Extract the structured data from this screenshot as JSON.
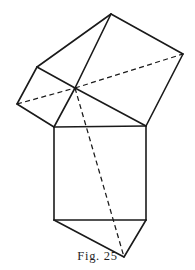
{
  "figure": {
    "caption": "Fig. 25",
    "caption_x": 97,
    "caption_y": 257,
    "background_color": "#ffffff",
    "line_color": "#1a1a1a",
    "solid_stroke_width": 1.6,
    "hidden_stroke_width": 1.25,
    "hidden_dash_pattern": "5 3.4",
    "canvas": {
      "width": 195,
      "height": 270
    },
    "vertices": {
      "apex_top": [
        111,
        14
      ],
      "upper_left": [
        37,
        67
      ],
      "left": [
        17,
        104
      ],
      "center": [
        75,
        88
      ],
      "right": [
        183,
        54
      ],
      "rect_top_left": [
        54,
        127
      ],
      "rect_top_right": [
        146,
        126
      ],
      "rect_bottom_right": [
        146,
        220
      ],
      "rect_bottom_left": [
        54,
        220
      ],
      "bottom_apex": [
        124,
        257
      ]
    },
    "solid_edges": [
      {
        "name": "apex-to-upper-left",
        "points": "111,14 37,67"
      },
      {
        "name": "upper-left-to-left",
        "points": "37,67 17,104"
      },
      {
        "name": "left-to-rect-top-left",
        "points": "17,104 54,127"
      },
      {
        "name": "apex-to-right",
        "points": "111,14 183,54"
      },
      {
        "name": "right-to-rect-top-right",
        "points": "183,54 146,126"
      },
      {
        "name": "apex-to-center",
        "points": "111,14 75,88"
      },
      {
        "name": "upper-left-to-center",
        "points": "37,67 75,88"
      },
      {
        "name": "center-to-rect-top-right",
        "points": "75,88 146,126"
      },
      {
        "name": "center-to-rect-top-left",
        "points": "75,88 54,127"
      },
      {
        "name": "rect-top-edge",
        "points": "54,127 146,126"
      },
      {
        "name": "rect-left-edge",
        "points": "54,127 54,220"
      },
      {
        "name": "rect-right-edge",
        "points": "146,126 146,220"
      },
      {
        "name": "rect-bottom-edge",
        "points": "54,220 146,220"
      },
      {
        "name": "rect-bottom-left-to-bottom-apex",
        "points": "54,220 124,257"
      },
      {
        "name": "rect-bottom-right-to-bottom-apex",
        "points": "146,220 124,257"
      }
    ],
    "hidden_edges": [
      {
        "name": "left-to-center-hidden",
        "points": "17,104 75,88"
      },
      {
        "name": "center-to-right-hidden",
        "points": "75,88 183,54"
      },
      {
        "name": "center-to-bottom-apex-hidden",
        "points": "75,88 124,257"
      }
    ]
  }
}
